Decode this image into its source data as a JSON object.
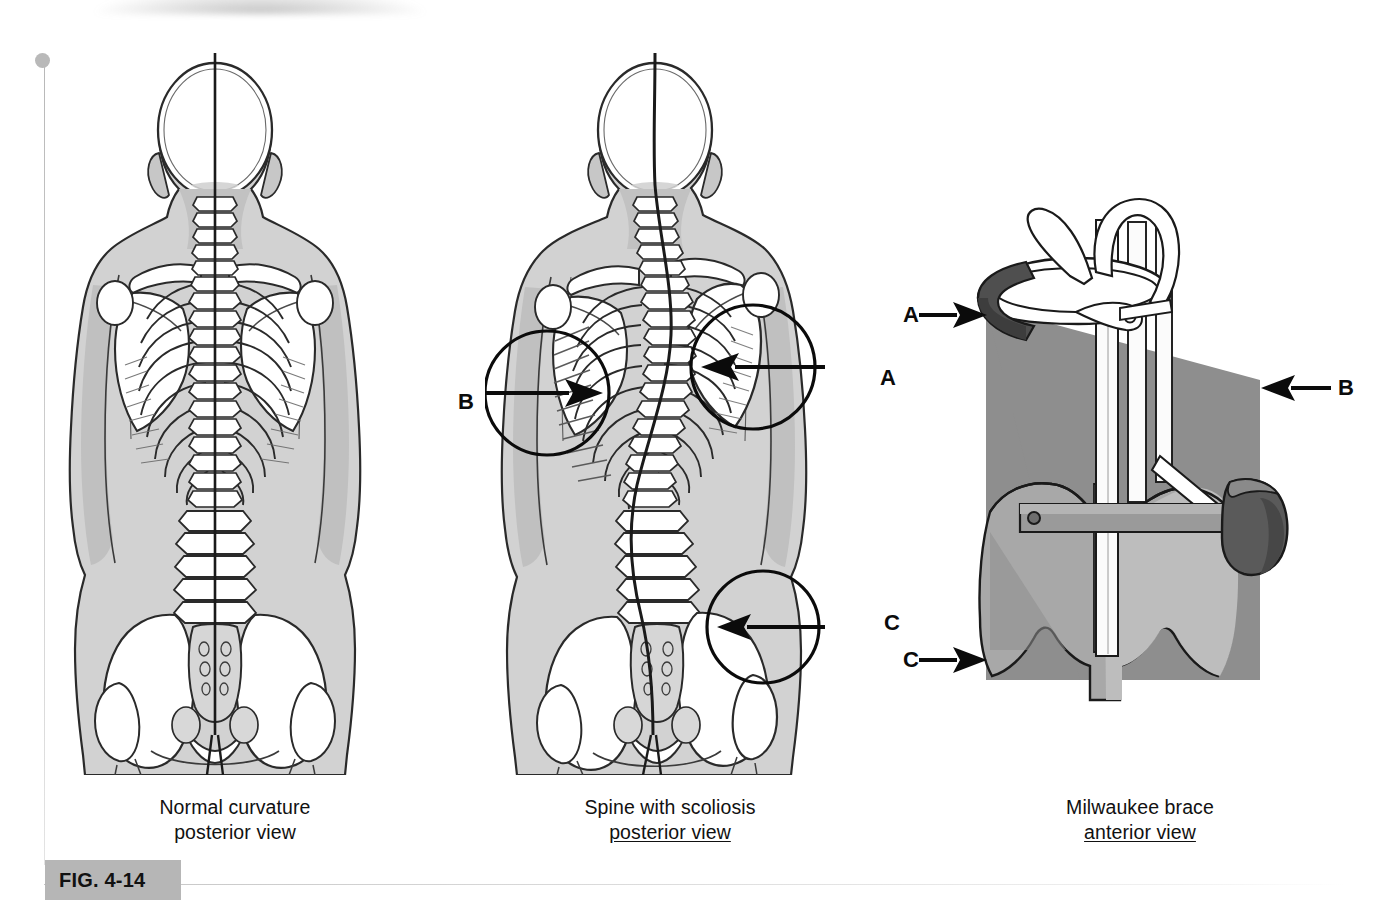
{
  "figure": {
    "tag": "FIG. 4-14",
    "topic": "Scoliosis: normal curvature, spine with scoliosis, and Milwaukee brace"
  },
  "panels": [
    {
      "id": "normal-spine",
      "caption_line1": "Normal curvature",
      "caption_line2": "posterior view",
      "caption_line2_underlined": false,
      "description": "Posterior view of skeleton with straight vertical plumb line through midline"
    },
    {
      "id": "scoliosis-spine",
      "caption_line1": "Spine with scoliosis",
      "caption_line2": "posterior view",
      "caption_line2_underlined": true,
      "description": "Posterior view of skeleton with S-shaped lateral spinal curvature"
    },
    {
      "id": "milwaukee-brace",
      "caption_line1": "Milwaukee brace",
      "caption_line2": "anterior view",
      "caption_line2_underlined": true,
      "description": "Anterior view of Milwaukee brace with neck ring, thoracic pad and pelvic girdle"
    }
  ],
  "callouts": [
    {
      "letter": "B",
      "panel": "scoliosis-spine",
      "arrow_direction": "right",
      "target": "rib-hump-left-thorax"
    },
    {
      "letter": "A",
      "panel": "scoliosis-spine",
      "arrow_direction": "left",
      "target": "elevated-shoulder-scapula"
    },
    {
      "letter": "C",
      "panel": "scoliosis-spine",
      "arrow_direction": "left",
      "target": "asymmetric-hip-iliac-crest"
    },
    {
      "letter": "A",
      "panel": "milwaukee-brace",
      "arrow_direction": "right",
      "target": "neck-ring"
    },
    {
      "letter": "B",
      "panel": "milwaukee-brace",
      "arrow_direction": "left",
      "target": "thoracic-pad"
    },
    {
      "letter": "C",
      "panel": "milwaukee-brace",
      "arrow_direction": "right",
      "target": "pelvic-girdle"
    }
  ],
  "colors": {
    "ink": "#1a1a1a",
    "bone": "#ffffff",
    "body_fill": "#d4d4d4",
    "body_shade": "#bdbdbd",
    "brace_shadow": "#8c8c8c",
    "brace_dark": "#6e6e6e",
    "brace_light": "#b0b0b0",
    "fig_tag_bg": "#b6b6b6",
    "page_bg": "#ffffff"
  }
}
